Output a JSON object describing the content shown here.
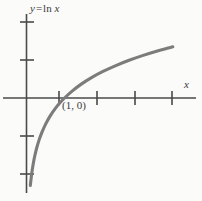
{
  "figure": {
    "background_color": "#fbfbfa",
    "axis_color": "#4a4a4a",
    "curve_color": "#7c7c7c",
    "text_color": "#3a3a3a",
    "curve_label": {
      "y": "y",
      "equals": "=",
      "ln": "ln",
      "x": "x",
      "full": "y = ln x"
    },
    "x_axis_label": "x",
    "point_label": "(1, 0)"
  },
  "chart_data": {
    "type": "line",
    "xlabel": "x",
    "ylabel": "",
    "function": "y = ln x",
    "grid": false,
    "legend": null,
    "annotations": [
      {
        "text": "(1, 0)",
        "x": 1,
        "y": 0
      },
      {
        "text": "y = ln x",
        "x": 0.12,
        "y": 2.6
      }
    ],
    "axis": {
      "x_origin_px": 26.5,
      "y_origin_px": 98,
      "x_unit_px": 38,
      "y_unit_px": 38,
      "xlim": [
        -0.7,
        4.6
      ],
      "ylim": [
        -2.7,
        2.7
      ],
      "x_ticks": [
        1,
        2,
        3,
        4
      ],
      "y_ticks": [
        -2,
        -1,
        1,
        2
      ],
      "x_tick_px": [
        59,
        97,
        135,
        172
      ],
      "y_tick_px": [
        174,
        136,
        60,
        22
      ]
    },
    "x": [
      0.1,
      0.14,
      0.18,
      0.22,
      0.27,
      0.33,
      0.4,
      0.5,
      0.62,
      0.75,
      0.88,
      1.0,
      1.2,
      1.45,
      1.7,
      2.0,
      2.35,
      2.7,
      3.05,
      3.4,
      3.7,
      3.85
    ],
    "y": [
      -2.303,
      -1.966,
      -1.715,
      -1.514,
      -1.309,
      -1.109,
      -0.916,
      -0.693,
      -0.478,
      -0.288,
      -0.128,
      0.0,
      0.182,
      0.372,
      0.531,
      0.693,
      0.854,
      0.993,
      1.115,
      1.224,
      1.308,
      1.348
    ]
  }
}
